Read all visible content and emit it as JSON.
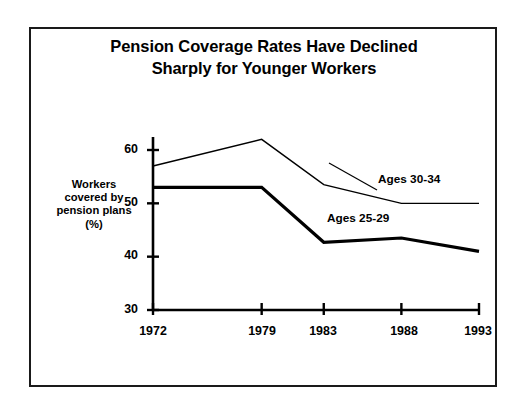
{
  "figure": {
    "title_line1": "Pension Coverage Rates Have Declined",
    "title_line2": "Sharply for Younger Workers",
    "background_color": "#ffffff",
    "border_color": "#1a1a1a"
  },
  "axes": {
    "ylabel_line1": "Workers",
    "ylabel_line2": "covered by",
    "ylabel_line3": "pension plans",
    "ylabel_line4": "(%)",
    "yticks": [
      "30",
      "40",
      "50",
      "60"
    ],
    "xticks": [
      "1972",
      "1979",
      "1983",
      "1988",
      "1993"
    ]
  },
  "annotations": {
    "series1_label": "Ages 30-34",
    "series2_label": "Ages 25-29"
  },
  "chart_data": {
    "type": "line",
    "title": "Pension Coverage Rates Have Declined Sharply for Younger Workers",
    "xlabel": "",
    "ylabel": "Workers covered by pension plans (%)",
    "x": [
      1972,
      1979,
      1983,
      1988,
      1993
    ],
    "xtick_labels": [
      "1972",
      "1979",
      "1983",
      "1988",
      "1993"
    ],
    "ylim": [
      30,
      63
    ],
    "xlim": [
      1972,
      1993
    ],
    "ytick_values": [
      30,
      40,
      50,
      60
    ],
    "grid": false,
    "legend": "inline-annotations",
    "series": [
      {
        "name": "Ages 30-34",
        "values": [
          57.0,
          62.0,
          53.5,
          50.0,
          50.0
        ],
        "line_width": 1.4,
        "color": "#000000"
      },
      {
        "name": "Ages 25-29",
        "values": [
          53.0,
          53.0,
          42.7,
          43.5,
          41.0
        ],
        "line_width": 3.2,
        "color": "#000000"
      }
    ]
  }
}
